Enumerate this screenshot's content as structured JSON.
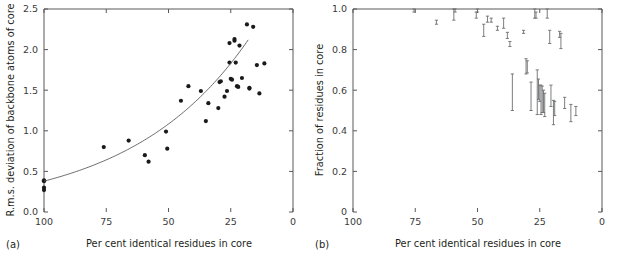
{
  "figure": {
    "background_color": "#ffffff",
    "ink_color": "#231f20",
    "axis_color": "#58595b",
    "point_color": "#1a1a1a",
    "curve_color": "#5a5a5c",
    "errorbar_color": "#6d6e70"
  },
  "panels": [
    {
      "tag": "(a)",
      "chart_data": {
        "type": "scatter",
        "title": "",
        "xlabel": "Per cent identical residues in core",
        "ylabel": "R.m.s. deviation of backbone atoms of core",
        "xlim": [
          100,
          0
        ],
        "ylim": [
          0.0,
          2.5
        ],
        "x_reversed": true,
        "grid": false,
        "legend": null,
        "xticks": [
          100,
          75,
          50,
          25,
          0
        ],
        "xticklabels": [
          "100",
          "75",
          "50",
          "25",
          "0"
        ],
        "yticks": [
          0.0,
          0.5,
          1.0,
          1.5,
          2.0,
          2.5
        ],
        "yticklabels": [
          "0.0",
          "0.5",
          "1.0",
          "1.5",
          "2.0",
          "2.5"
        ],
        "points": [
          [
            100,
            0.39
          ],
          [
            100,
            0.38
          ],
          [
            100,
            0.3
          ],
          [
            100,
            0.27
          ],
          [
            76,
            0.8
          ],
          [
            66,
            0.88
          ],
          [
            59.5,
            0.7
          ],
          [
            58,
            0.62
          ],
          [
            51,
            0.99
          ],
          [
            50.5,
            0.78
          ],
          [
            45,
            1.37
          ],
          [
            42,
            1.55
          ],
          [
            37,
            1.49
          ],
          [
            35,
            1.12
          ],
          [
            34,
            1.34
          ],
          [
            30,
            1.28
          ],
          [
            29.5,
            1.6
          ],
          [
            29,
            1.61
          ],
          [
            27.5,
            1.42
          ],
          [
            26.5,
            1.49
          ],
          [
            25.5,
            2.08
          ],
          [
            25.5,
            1.84
          ],
          [
            25,
            1.64
          ],
          [
            24.5,
            1.63
          ],
          [
            23.5,
            2.13
          ],
          [
            23.5,
            2.11
          ],
          [
            23,
            1.84
          ],
          [
            22.5,
            1.55
          ],
          [
            22,
            1.54
          ],
          [
            21.5,
            2.05
          ],
          [
            20.5,
            1.65
          ],
          [
            18.5,
            2.31
          ],
          [
            17.5,
            1.53
          ],
          [
            17.5,
            1.52
          ],
          [
            16,
            2.28
          ],
          [
            14.5,
            1.81
          ],
          [
            13.5,
            1.46
          ],
          [
            11.5,
            1.83
          ]
        ],
        "fit_curve": {
          "description": "monotonic exponential fit rising right-to-left-reversed",
          "x_start": 100,
          "x_end": 18,
          "y_start": 0.38,
          "y_end": 2.12
        }
      }
    },
    {
      "tag": "(b)",
      "chart_data": {
        "type": "scatter",
        "title": "",
        "xlabel": "Per cent identical residues in core",
        "ylabel": "Fraction of residues in core",
        "xlim": [
          100,
          0
        ],
        "ylim": [
          0.0,
          1.0
        ],
        "x_reversed": true,
        "grid": false,
        "legend": null,
        "xticks": [
          100,
          75,
          50,
          25,
          0
        ],
        "xticklabels": [
          "100",
          "75",
          "50",
          "25",
          "0"
        ],
        "yticks": [
          0.0,
          0.2,
          0.4,
          0.6,
          0.8,
          1.0
        ],
        "yticklabels": [
          "0",
          "0.2",
          "0.4",
          "0.6",
          "0.8",
          "1.0"
        ],
        "errorbars": [
          [
            75.5,
            1.0,
            0.985
          ],
          [
            66.5,
            0.945,
            0.925
          ],
          [
            59.5,
            1.0,
            0.945
          ],
          [
            59.0,
            1.0,
            0.985
          ],
          [
            50.5,
            0.985,
            0.955
          ],
          [
            50.0,
            1.0,
            0.985
          ],
          [
            47.5,
            0.925,
            0.865
          ],
          [
            46.0,
            0.965,
            0.935
          ],
          [
            44.5,
            0.955,
            0.935
          ],
          [
            42.0,
            0.915,
            0.895
          ],
          [
            39.5,
            0.955,
            0.905
          ],
          [
            38.0,
            0.885,
            0.855
          ],
          [
            37.0,
            0.84,
            0.815
          ],
          [
            36.0,
            0.68,
            0.5
          ],
          [
            31.5,
            0.895,
            0.88
          ],
          [
            30.5,
            0.755,
            0.68
          ],
          [
            30.0,
            0.745,
            0.685
          ],
          [
            28.5,
            0.64,
            0.5
          ],
          [
            27.0,
            1.0,
            0.955
          ],
          [
            26.5,
            0.985,
            0.955
          ],
          [
            26.0,
            0.7,
            0.48
          ],
          [
            25.5,
            0.655,
            0.555
          ],
          [
            25.0,
            0.625,
            0.545
          ],
          [
            24.5,
            0.625,
            0.48
          ],
          [
            24.0,
            0.62,
            0.49
          ],
          [
            23.5,
            0.6,
            0.49
          ],
          [
            23.0,
            0.585,
            0.47
          ],
          [
            22.0,
            1.0,
            0.955
          ],
          [
            21.0,
            0.895,
            0.83
          ],
          [
            20.5,
            0.625,
            0.52
          ],
          [
            19.5,
            0.55,
            0.43
          ],
          [
            19.0,
            0.545,
            0.475
          ],
          [
            17.0,
            0.89,
            0.86
          ],
          [
            16.5,
            0.88,
            0.805
          ],
          [
            15.0,
            0.565,
            0.51
          ],
          [
            12.5,
            0.53,
            0.445
          ],
          [
            10.5,
            0.52,
            0.475
          ]
        ]
      }
    }
  ]
}
